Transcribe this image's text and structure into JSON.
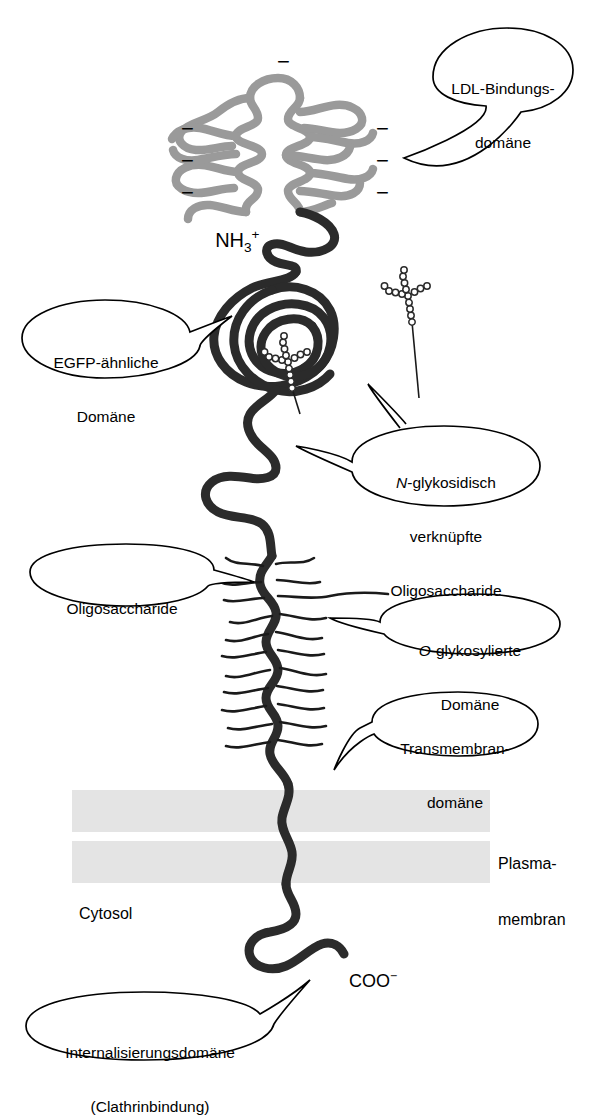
{
  "figure": {
    "colors": {
      "backbone": "#2b2b2b",
      "ldl_domain": "#9a9a9a",
      "membrane": "#e2e2e2",
      "outline": "#000000",
      "background": "#ffffff"
    }
  },
  "callouts": {
    "ldl_binding": {
      "lines": [
        "LDL-Bindungs-",
        "domäne"
      ]
    },
    "egfp_like": {
      "lines": [
        "EGFP-ähnliche",
        "Domäne"
      ]
    },
    "n_glyco": {
      "lead_italic": "N",
      "lines": [
        "-glykosidisch",
        "verknüpfte",
        "Oligosaccharide"
      ]
    },
    "oligo": {
      "lines": [
        "Oligosaccharide"
      ]
    },
    "o_glyco": {
      "lead_italic": "O",
      "lines": [
        "-glykosylierte",
        "Domäne"
      ]
    },
    "transmembrane": {
      "lines": [
        "Transmembran-",
        "domäne"
      ]
    },
    "internalization": {
      "lines": [
        "Internalisierungsdomäne",
        "(Clathrinbindung)"
      ]
    }
  },
  "terminals": {
    "n_terminus": {
      "base": "NH",
      "sub": "3",
      "sup": "+"
    },
    "c_terminus": {
      "base": "COO",
      "sup": "−"
    }
  },
  "annotations": {
    "plasma_membrane": {
      "lines": [
        "Plasma-",
        "membran"
      ]
    },
    "cytosol": {
      "text": "Cytosol"
    }
  },
  "charges": {
    "symbol": "−",
    "count": 7,
    "positions": [
      "top-center",
      "left-upper",
      "left-middle",
      "left-lower",
      "right-upper",
      "right-middle",
      "right-lower"
    ]
  }
}
